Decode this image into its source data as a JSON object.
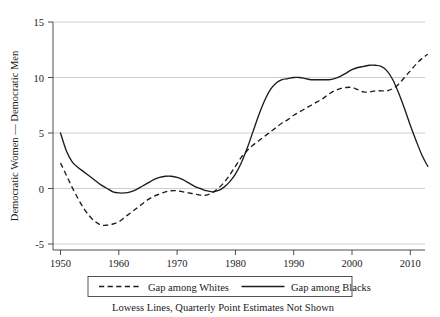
{
  "chart_data": {
    "type": "line",
    "title": "",
    "subtitle": "",
    "xlabel": "",
    "ylabel": "Democratic Women — Democratic Men",
    "caption": "Lowess Lines, Quarterly Point Estimates Not Shown",
    "xlim": [
      1948,
      2014
    ],
    "ylim": [
      -6.5,
      15.5
    ],
    "xticks": [
      1950,
      1960,
      1970,
      1980,
      1990,
      2000,
      2010
    ],
    "xticklabels": [
      "1950",
      "1960",
      "1970",
      "1980",
      "1990",
      "2000",
      "2010"
    ],
    "yticks": [
      -5,
      0,
      5,
      10,
      15
    ],
    "yticklabels": [
      "-5",
      "0",
      "5",
      "10",
      "15"
    ],
    "grid": "horizontal",
    "legend_position": "below-axes",
    "legend": [
      {
        "label": "Gap among Whites",
        "style": "dashed"
      },
      {
        "label": "Gap among Blacks",
        "style": "solid"
      }
    ],
    "series": [
      {
        "name": "Gap among Whites",
        "style": "dashed",
        "x": [
          1950,
          1951,
          1952,
          1953,
          1954,
          1955,
          1956,
          1957,
          1958,
          1959,
          1960,
          1961,
          1962,
          1963,
          1964,
          1965,
          1966,
          1967,
          1968,
          1969,
          1970,
          1971,
          1972,
          1973,
          1974,
          1975,
          1976,
          1977,
          1978,
          1979,
          1980,
          1981,
          1982,
          1983,
          1984,
          1985,
          1986,
          1987,
          1988,
          1989,
          1990,
          1991,
          1992,
          1993,
          1994,
          1995,
          1996,
          1997,
          1998,
          1999,
          2000,
          2001,
          2002,
          2003,
          2004,
          2005,
          2006,
          2007,
          2008,
          2009,
          2010,
          2011,
          2012,
          2013
        ],
        "values": [
          2.3,
          1.2,
          0.1,
          -0.9,
          -1.8,
          -2.5,
          -3.0,
          -3.3,
          -3.3,
          -3.2,
          -3.0,
          -2.6,
          -2.2,
          -1.8,
          -1.4,
          -1.0,
          -0.7,
          -0.5,
          -0.3,
          -0.2,
          -0.2,
          -0.3,
          -0.4,
          -0.5,
          -0.6,
          -0.6,
          -0.4,
          0.0,
          0.5,
          1.2,
          2.0,
          2.8,
          3.4,
          3.9,
          4.3,
          4.7,
          5.1,
          5.5,
          5.9,
          6.2,
          6.6,
          6.9,
          7.2,
          7.5,
          7.8,
          8.1,
          8.5,
          8.8,
          9.0,
          9.1,
          9.1,
          8.9,
          8.7,
          8.7,
          8.8,
          8.8,
          8.8,
          9.0,
          9.4,
          10.0,
          10.6,
          11.2,
          11.7,
          12.1
        ]
      },
      {
        "name": "Gap among Blacks",
        "style": "solid",
        "x": [
          1950,
          1951,
          1952,
          1953,
          1954,
          1955,
          1956,
          1957,
          1958,
          1959,
          1960,
          1961,
          1962,
          1963,
          1964,
          1965,
          1966,
          1967,
          1968,
          1969,
          1970,
          1971,
          1972,
          1973,
          1974,
          1975,
          1976,
          1977,
          1978,
          1979,
          1980,
          1981,
          1982,
          1983,
          1984,
          1985,
          1986,
          1987,
          1988,
          1989,
          1990,
          1991,
          1992,
          1993,
          1994,
          1995,
          1996,
          1997,
          1998,
          1999,
          2000,
          2001,
          2002,
          2003,
          2004,
          2005,
          2006,
          2007,
          2008,
          2009,
          2010,
          2011,
          2012,
          2013
        ],
        "values": [
          5.0,
          3.4,
          2.4,
          1.9,
          1.5,
          1.1,
          0.7,
          0.3,
          0.0,
          -0.3,
          -0.4,
          -0.4,
          -0.3,
          -0.1,
          0.2,
          0.5,
          0.8,
          1.0,
          1.1,
          1.1,
          1.0,
          0.8,
          0.5,
          0.2,
          0.0,
          -0.2,
          -0.3,
          -0.2,
          0.1,
          0.6,
          1.3,
          2.3,
          3.6,
          5.1,
          6.6,
          7.9,
          8.9,
          9.5,
          9.8,
          9.9,
          10.0,
          10.0,
          9.9,
          9.8,
          9.8,
          9.8,
          9.8,
          9.9,
          10.1,
          10.4,
          10.7,
          10.9,
          11.0,
          11.1,
          11.1,
          11.0,
          10.6,
          9.8,
          8.6,
          7.2,
          5.7,
          4.3,
          3.0,
          2.0
        ]
      }
    ]
  }
}
